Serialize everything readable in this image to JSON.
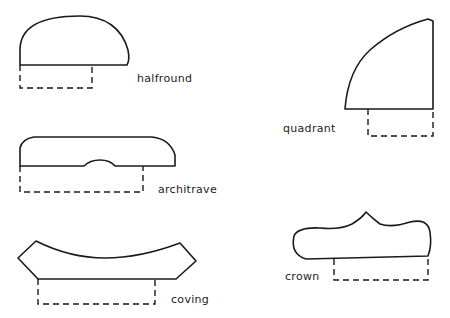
{
  "diagram": {
    "moldings": [
      {
        "id": "halfround",
        "label": "halfround"
      },
      {
        "id": "architrave",
        "label": "architrave"
      },
      {
        "id": "coving",
        "label": "coving"
      },
      {
        "id": "quadrant",
        "label": "quadrant"
      },
      {
        "id": "crown",
        "label": "crown"
      }
    ],
    "colors": {
      "stroke": "#1a1a1a",
      "background": "#ffffff"
    }
  }
}
